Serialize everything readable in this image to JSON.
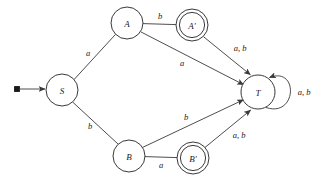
{
  "figure": {
    "type": "finite-state-automaton-diagram",
    "background_color": "#ffffff",
    "stroke_color": "#3a3a3a",
    "text_color": "#1a1a1a",
    "width": 329,
    "height": 184
  },
  "states": [
    {
      "id": "S",
      "label": "S",
      "x": 62,
      "y": 90,
      "r": 16,
      "accepting": false,
      "start": true
    },
    {
      "id": "A",
      "label": "A",
      "x": 127,
      "y": 23,
      "r": 16,
      "accepting": false,
      "start": false
    },
    {
      "id": "Ap",
      "label": "A'",
      "x": 192,
      "y": 25,
      "r": 13,
      "r_outer": 16,
      "accepting": true,
      "start": false
    },
    {
      "id": "B",
      "label": "B",
      "x": 129,
      "y": 156,
      "r": 16,
      "accepting": false,
      "start": false
    },
    {
      "id": "Bp",
      "label": "B'",
      "x": 193,
      "y": 158,
      "r": 13,
      "r_outer": 16,
      "accepting": true,
      "start": false
    },
    {
      "id": "T",
      "label": "T",
      "x": 258,
      "y": 92,
      "r": 17,
      "accepting": false,
      "start": false
    }
  ],
  "transitions": [
    {
      "from": "S",
      "to": "A",
      "label": "a",
      "label_x": 88,
      "label_y": 53
    },
    {
      "from": "S",
      "to": "B",
      "label": "b",
      "label_x": 90,
      "label_y": 126
    },
    {
      "from": "A",
      "to": "Ap",
      "label": "b",
      "label_x": 160,
      "label_y": 17
    },
    {
      "from": "A",
      "to": "T",
      "label": "a",
      "label_x": 182,
      "label_y": 63
    },
    {
      "from": "Ap",
      "to": "T",
      "label": "a, b",
      "label_x": 238,
      "label_y": 50
    },
    {
      "from": "B",
      "to": "Bp",
      "label": "a",
      "label_x": 161,
      "label_y": 162
    },
    {
      "from": "B",
      "to": "T",
      "label": "b",
      "label_x": 186,
      "label_y": 117
    },
    {
      "from": "Bp",
      "to": "T",
      "label": "a, b",
      "label_x": 237,
      "label_y": 137
    },
    {
      "from": "T",
      "to": "T",
      "label": "a, b",
      "label_x": 303,
      "label_y": 92,
      "self_loop": true
    }
  ],
  "start_marker": {
    "dot_x": 17,
    "dot_y": 89,
    "arrow_tip_x": 45,
    "arrow_tip_y": 89
  }
}
